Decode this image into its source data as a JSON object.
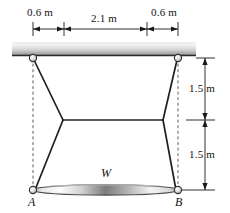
{
  "figure": {
    "colors": {
      "line": "#1a1a1a",
      "dashed": "#555555",
      "ceiling_light": "#f2f2f2",
      "ceiling_dark": "#8a8a8a",
      "bar_light": "#ffffff",
      "bar_dark": "#6e6e6e",
      "background": "#ffffff"
    }
  },
  "dimensions": {
    "top": [
      {
        "key": "left_offset",
        "label": "0.6 m"
      },
      {
        "key": "span",
        "label": "2.1 m"
      },
      {
        "key": "right_offset",
        "label": "0.6 m"
      }
    ],
    "right": [
      {
        "key": "upper",
        "label": "1.5 m"
      },
      {
        "key": "lower",
        "label": "1.5 m"
      }
    ]
  },
  "labels": {
    "point_a": "A",
    "point_b": "B",
    "weight": "W"
  }
}
